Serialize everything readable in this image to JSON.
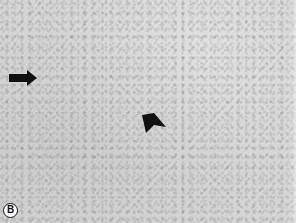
{
  "figure": {
    "type": "grayscale micrograph",
    "panel_label": "B",
    "annotations": [
      {
        "kind": "arrow",
        "direction": "right",
        "color": "#111111"
      },
      {
        "kind": "arrowhead",
        "direction": "down-left",
        "color": "#111111"
      }
    ],
    "background_color": "#d6d6d6"
  }
}
